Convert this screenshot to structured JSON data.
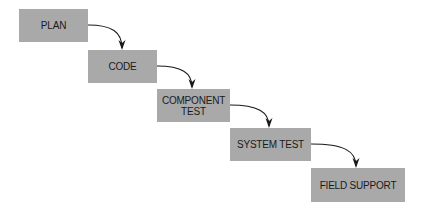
{
  "diagram": {
    "type": "waterfall",
    "colors": {
      "box_fill": "#a9a9a9",
      "text": "#1a1a1a",
      "arrow": "#1a1a1a",
      "background": "#ffffff"
    },
    "stages": [
      {
        "label": "PLAN"
      },
      {
        "label": "CODE"
      },
      {
        "label": "COMPONENT TEST",
        "line1": "COMPONENT",
        "line2": "TEST"
      },
      {
        "label": "SYSTEM TEST"
      },
      {
        "label": "FIELD SUPPORT"
      }
    ],
    "connections": [
      {
        "from": "PLAN",
        "to": "CODE"
      },
      {
        "from": "CODE",
        "to": "COMPONENT TEST"
      },
      {
        "from": "COMPONENT TEST",
        "to": "SYSTEM TEST"
      },
      {
        "from": "SYSTEM TEST",
        "to": "FIELD SUPPORT"
      }
    ]
  }
}
